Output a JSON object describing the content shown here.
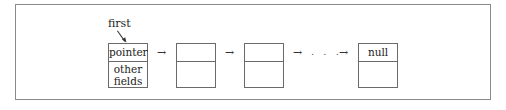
{
  "diagram": {
    "type": "linked-list",
    "head_label": "first",
    "nodes": [
      {
        "top": "pointer",
        "bottom": "other\nfields"
      },
      {
        "top": "",
        "bottom": ""
      },
      {
        "top": "",
        "bottom": ""
      },
      {
        "top": "null",
        "bottom": ""
      }
    ],
    "arrow_glyph": "→",
    "ellipsis": ". . ."
  }
}
